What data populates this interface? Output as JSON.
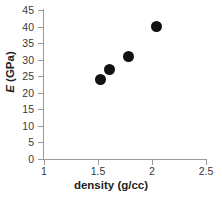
{
  "chart_data": {
    "type": "scatter",
    "title": "",
    "xlabel": "density (g/cc)",
    "ylabel": "E (GPa)",
    "ylabel_symbol": "E",
    "ylabel_unit": " (GPa)",
    "xlim": [
      1,
      2.5
    ],
    "ylim": [
      0,
      45
    ],
    "grid": false,
    "legend": "none",
    "marker": "filled-circle",
    "marker_color": "#111111",
    "axis_color": "#9a9a9a",
    "x_ticks": [
      1,
      1.5,
      2,
      2.5
    ],
    "x_tick_labels": [
      "1",
      "1.5",
      "2",
      "2.5"
    ],
    "y_ticks": [
      0,
      5,
      10,
      15,
      20,
      25,
      30,
      35,
      40,
      45
    ],
    "y_tick_labels": [
      "0",
      "5",
      "10",
      "15",
      "20",
      "25",
      "30",
      "35",
      "40",
      "45"
    ],
    "points": [
      {
        "x": 1.52,
        "y": 24
      },
      {
        "x": 1.61,
        "y": 27
      },
      {
        "x": 1.78,
        "y": 31
      },
      {
        "x": 2.04,
        "y": 40
      }
    ],
    "x": [
      1.52,
      1.61,
      1.78,
      2.04
    ],
    "values": [
      24,
      27,
      31,
      40
    ]
  }
}
